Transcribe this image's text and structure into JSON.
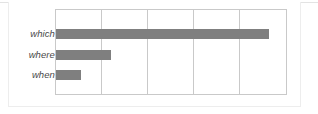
{
  "figure": {
    "kind": "horizontal-bar-chart",
    "background_color": "#ffffff",
    "frame_color": "#ededed",
    "grid_color": "#c9c9c9",
    "bar_color": "#7f7f7f",
    "label_color": "#4a4a4a"
  },
  "chart_data": {
    "type": "bar",
    "orientation": "horizontal",
    "title": "",
    "subtitle": "",
    "xlabel": "",
    "ylabel": "",
    "categories": [
      "which",
      "where",
      "when"
    ],
    "values": [
      4.6,
      1.2,
      0.55
    ],
    "series": [
      {
        "name": "",
        "values": [
          4.6,
          1.2,
          0.55
        ],
        "color": "#7f7f7f"
      }
    ],
    "xlim": [
      0,
      5
    ],
    "xticks": [
      0,
      1,
      2,
      3,
      4,
      5
    ],
    "xticklabels": [
      "",
      "",
      "",
      "",
      "",
      ""
    ],
    "yticklabels": [
      "which",
      "where",
      "when"
    ],
    "grid": {
      "vertical": true,
      "horizontal": false,
      "count": 6
    },
    "legend": {
      "visible": false,
      "position": "none"
    },
    "data_labels": false,
    "annotations": []
  },
  "axis": {
    "tick_labels_italic": true
  }
}
